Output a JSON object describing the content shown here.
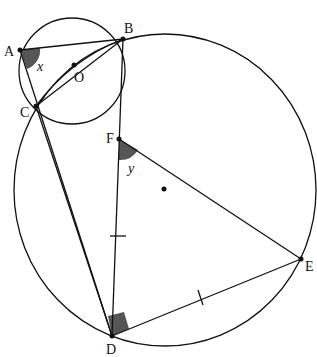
{
  "diagram": {
    "type": "geometry",
    "points": {
      "A": {
        "label": "A",
        "x": 20,
        "y": 50
      },
      "B": {
        "label": "B",
        "x": 123,
        "y": 39
      },
      "C": {
        "label": "C",
        "x": 36,
        "y": 106
      },
      "O": {
        "label": "O",
        "x": 74,
        "y": 65
      },
      "F": {
        "label": "F",
        "x": 119,
        "y": 139
      },
      "D": {
        "label": "D",
        "x": 112,
        "y": 336
      },
      "E": {
        "label": "E",
        "x": 301,
        "y": 259
      },
      "center_big": {
        "x": 164,
        "y": 189
      }
    },
    "angles": {
      "x": {
        "label": "x",
        "at": "A"
      },
      "y": {
        "label": "y",
        "at": "F"
      },
      "right_angle_at": "D"
    },
    "colors": {
      "stroke": "#111111",
      "fill_angle": "#555555"
    }
  }
}
